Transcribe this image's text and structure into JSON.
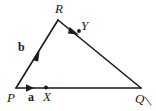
{
  "figure": {
    "background_color": "#ffffff",
    "stroke_color": "#1a1a1a",
    "vertices": [
      {
        "name": "P",
        "label": "P",
        "x": 16,
        "y": 88
      },
      {
        "name": "Q",
        "label": "Q",
        "x": 141,
        "y": 88
      },
      {
        "name": "R",
        "label": "R",
        "x": 58,
        "y": 20
      }
    ],
    "points": [
      {
        "name": "X",
        "label": "X",
        "x": 46,
        "y": 88,
        "on_segment": "PQ"
      },
      {
        "name": "Y",
        "label": "Y",
        "x": 79,
        "y": 31,
        "on_segment": "RQ"
      }
    ],
    "vectors": [
      {
        "name": "a",
        "label": "a",
        "along": "PQ",
        "arrow_at_x": 32,
        "arrow_at_y": 88
      },
      {
        "name": "b",
        "label": "b",
        "along": "PR",
        "arrow_at_x": 37,
        "arrow_at_y": 55
      }
    ],
    "segments": [
      {
        "name": "PQ",
        "from": "P",
        "to": "Q"
      },
      {
        "name": "PR",
        "from": "P",
        "to": "R"
      },
      {
        "name": "RQ",
        "from": "R",
        "to": "Q"
      }
    ],
    "tick_mark": {
      "name": "corner-tick",
      "near": "Q"
    }
  }
}
